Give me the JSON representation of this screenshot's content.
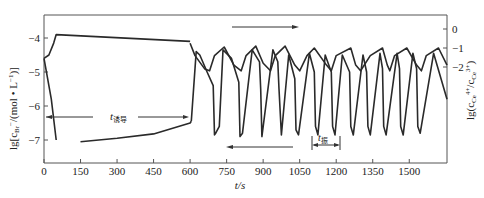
{
  "chart_data": {
    "type": "line",
    "title": "",
    "xlabel": "t/s",
    "ylabel_left": "lg[c_Br- /(mol·L-1)]",
    "ylabel_right": "lg(c_Ce4+ / c_Ce3+)",
    "xlim": [
      0,
      1655
    ],
    "ylim_left": [
      -7.7,
      -3.35
    ],
    "ylim_right": [
      -2.0,
      0.7
    ],
    "x_ticks": [
      0,
      150,
      300,
      450,
      600,
      750,
      900,
      1050,
      1200,
      1350,
      1500
    ],
    "y_ticks_left": [
      -4,
      -5,
      -6,
      -7
    ],
    "y_ticks_right": [
      0,
      -1,
      -2
    ],
    "grid": false,
    "annotations": [
      {
        "text": "t诱导",
        "meaning": "induction period",
        "x_range": [
          0,
          605
        ],
        "y": -6.25
      },
      {
        "text": "t振",
        "meaning": "oscillation period",
        "x_range": [
          1120,
          1230
        ],
        "y": -7.0
      },
      {
        "text": "→",
        "meaning": "upper curve read on right axis",
        "x_range": [
          730,
          1005
        ]
      },
      {
        "text": "←",
        "meaning": "lower curve read on left axis",
        "x_range": [
          760,
          1030
        ]
      }
    ],
    "series": [
      {
        "name": "lg c(Br-) initial decay",
        "axis": "left",
        "x": [
          0,
          30,
          50
        ],
        "y": [
          -4.6,
          -5.8,
          -7.0
        ]
      },
      {
        "name": "lg c(Br-) induction rise",
        "axis": "left",
        "x": [
          150,
          300,
          450,
          600,
          605
        ],
        "y": [
          -7.05,
          -6.95,
          -6.82,
          -6.5,
          -6.45
        ]
      },
      {
        "name": "lg c(Br-) oscillation",
        "axis": "left",
        "x": [
          605,
          625,
          640,
          670,
          695,
          700,
          705,
          720,
          735,
          770,
          800,
          805,
          815,
          855,
          885,
          890,
          895,
          940,
          960,
          965,
          975,
          1005,
          1030,
          1035,
          1045,
          1090,
          1110,
          1115,
          1125,
          1155,
          1180,
          1185,
          1195,
          1225,
          1255,
          1260,
          1270,
          1310,
          1325,
          1330,
          1340,
          1380,
          1390,
          1395,
          1405,
          1450,
          1460,
          1465,
          1475,
          1515,
          1530,
          1535,
          1545,
          1600,
          1655
        ],
        "y": [
          -6.45,
          -4.4,
          -4.5,
          -5.0,
          -5.4,
          -6.85,
          -6.8,
          -6.6,
          -4.35,
          -4.6,
          -5.3,
          -6.9,
          -6.8,
          -4.35,
          -4.7,
          -5.5,
          -6.9,
          -4.35,
          -4.7,
          -5.5,
          -6.85,
          -4.5,
          -5.2,
          -6.7,
          -6.85,
          -4.45,
          -5.0,
          -6.6,
          -6.85,
          -4.5,
          -5.0,
          -6.6,
          -6.85,
          -4.5,
          -5.0,
          -6.6,
          -6.85,
          -4.5,
          -5.0,
          -6.6,
          -6.85,
          -4.45,
          -4.9,
          -6.6,
          -6.85,
          -4.45,
          -4.9,
          -6.6,
          -6.85,
          -4.45,
          -4.9,
          -6.6,
          -6.8,
          -4.45,
          -5.8
        ]
      },
      {
        "name": "lg c(Br-) induction plateau",
        "axis": "left",
        "x": [
          0,
          20,
          40,
          50,
          600
        ],
        "y": [
          -4.6,
          -4.5,
          -4.15,
          -3.9,
          -4.1
        ]
      },
      {
        "name": "lg(c Ce4+/c Ce3+) oscillation",
        "axis": "right",
        "x": [
          600,
          620,
          660,
          680,
          700,
          740,
          780,
          810,
          830,
          870,
          900,
          930,
          950,
          990,
          1030,
          1050,
          1080,
          1110,
          1160,
          1180,
          1200,
          1260,
          1280,
          1300,
          1340,
          1390,
          1410,
          1420,
          1440,
          1490,
          1530,
          1550,
          1570,
          1620,
          1655
        ],
        "y": [
          -0.75,
          -1.4,
          -2.1,
          -2.2,
          -1.4,
          -0.95,
          -1.9,
          -2.2,
          -1.4,
          -0.9,
          -1.8,
          -2.2,
          -1.4,
          -0.9,
          -1.9,
          -2.2,
          -1.4,
          -1.0,
          -1.9,
          -2.2,
          -1.4,
          -1.0,
          -1.9,
          -2.2,
          -1.4,
          -1.0,
          -1.9,
          -2.2,
          -1.4,
          -1.0,
          -1.9,
          -2.2,
          -1.4,
          -1.0,
          -1.9
        ]
      }
    ]
  },
  "labels": {
    "xlabel": "t/s",
    "ylabel_left_main": "lg[c",
    "ylabel_left_sub": "Br",
    "ylabel_left_sup": "−",
    "ylabel_left_rest": "/(mol • L",
    "ylabel_left_unit_sup": "−1",
    "ylabel_left_end": ")]",
    "ylabel_right_main": "lg(c",
    "ylabel_right_sub1": "Ce",
    "ylabel_right_sup1": "4+",
    "ylabel_right_mid": "/c",
    "ylabel_right_sub2": "Ce",
    "ylabel_right_sup2": "3+",
    "ylabel_right_end": ")",
    "induction_label_main": "t",
    "induction_label_sub": "诱导",
    "period_label_main": "t",
    "period_label_sub": "振"
  }
}
